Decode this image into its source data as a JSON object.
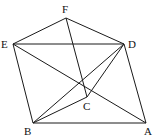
{
  "diagram": {
    "type": "geometry-figure",
    "points": [
      {
        "id": "F",
        "label": "F",
        "x": 66,
        "y": 18,
        "lx": 62,
        "ly": 13
      },
      {
        "id": "E",
        "label": "E",
        "x": 13,
        "y": 44,
        "lx": 1,
        "ly": 48
      },
      {
        "id": "D",
        "label": "D",
        "x": 124,
        "y": 44,
        "lx": 128,
        "ly": 48
      },
      {
        "id": "C",
        "label": "C",
        "x": 87,
        "y": 97,
        "lx": 83,
        "ly": 110
      },
      {
        "id": "B",
        "label": "B",
        "x": 33,
        "y": 123,
        "lx": 24,
        "ly": 135
      },
      {
        "id": "A",
        "label": "A",
        "x": 146,
        "y": 123,
        "lx": 144,
        "ly": 135
      }
    ],
    "edges": [
      [
        "F",
        "E"
      ],
      [
        "F",
        "D"
      ],
      [
        "F",
        "C"
      ],
      [
        "E",
        "D"
      ],
      [
        "E",
        "B"
      ],
      [
        "E",
        "A"
      ],
      [
        "D",
        "C"
      ],
      [
        "D",
        "B"
      ],
      [
        "D",
        "A"
      ],
      [
        "C",
        "B"
      ],
      [
        "B",
        "A"
      ]
    ],
    "colors": {
      "line": "#1a1a1a",
      "text": "#111111",
      "background": "#ffffff"
    }
  }
}
